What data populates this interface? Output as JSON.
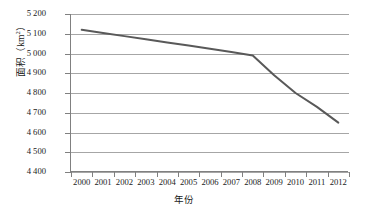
{
  "chart_data": {
    "type": "line",
    "title": "",
    "xlabel": "年份",
    "ylabel": "面积（km2）",
    "ylabel_base": "面积（km",
    "ylabel_sup": "2",
    "ylabel_tail": "）",
    "x": [
      2000,
      2001,
      2002,
      2003,
      2004,
      2005,
      2006,
      2007,
      2008,
      2009,
      2010,
      2011,
      2012
    ],
    "categories": [
      "2000",
      "2001",
      "2002",
      "2003",
      "2004",
      "2005",
      "2006",
      "2007",
      "2008",
      "2009",
      "2010",
      "2011",
      "2012"
    ],
    "series": [
      {
        "name": "面积",
        "values": [
          5120,
          5104,
          5088,
          5072,
          5056,
          5040,
          5024,
          5008,
          4990,
          4890,
          4800,
          4730,
          4650
        ],
        "color": "#595959"
      }
    ],
    "xtick_labels": [
      "2000",
      "2001",
      "2002",
      "2003",
      "2004",
      "2005",
      "2006",
      "2007",
      "2008",
      "2009",
      "2010",
      "2011",
      "2012"
    ],
    "ytick_labels": [
      "4 400",
      "4 500",
      "4 600",
      "4 700",
      "4 800",
      "4 900",
      "5 000",
      "5 100",
      "5 200"
    ],
    "ytick_values": [
      4400,
      4500,
      4600,
      4700,
      4800,
      4900,
      5000,
      5100,
      5200
    ],
    "ylim": [
      4400,
      5200
    ],
    "ytick_step": 100,
    "grid": true,
    "grid_color": "#a6a6a6",
    "axis_color": "#808080",
    "legend": null,
    "legend_position": "none",
    "background": "#ffffff"
  }
}
